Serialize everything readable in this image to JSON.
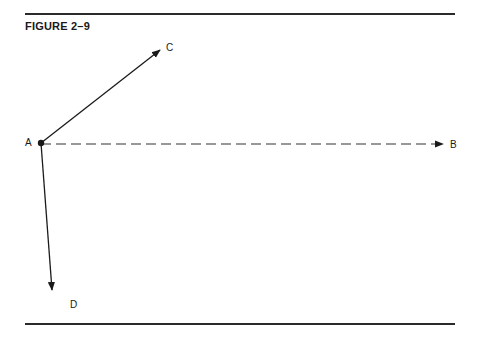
{
  "figure": {
    "title": "FIGURE 2–9"
  },
  "diagram": {
    "origin": {
      "id": "A",
      "label": "A",
      "x": 41,
      "y": 143
    },
    "vectors": [
      {
        "id": "AC",
        "from": "A",
        "to": "C",
        "style": "solid",
        "end": {
          "x": 160,
          "y": 50
        }
      },
      {
        "id": "AB",
        "from": "A",
        "to": "B",
        "style": "dashed",
        "end": {
          "x": 443,
          "y": 144
        }
      },
      {
        "id": "AD",
        "from": "A",
        "to": "D",
        "style": "solid",
        "end": {
          "x": 52,
          "y": 290
        }
      }
    ],
    "labels": {
      "A": "A",
      "B": "B",
      "C": "C",
      "D": "D"
    }
  }
}
